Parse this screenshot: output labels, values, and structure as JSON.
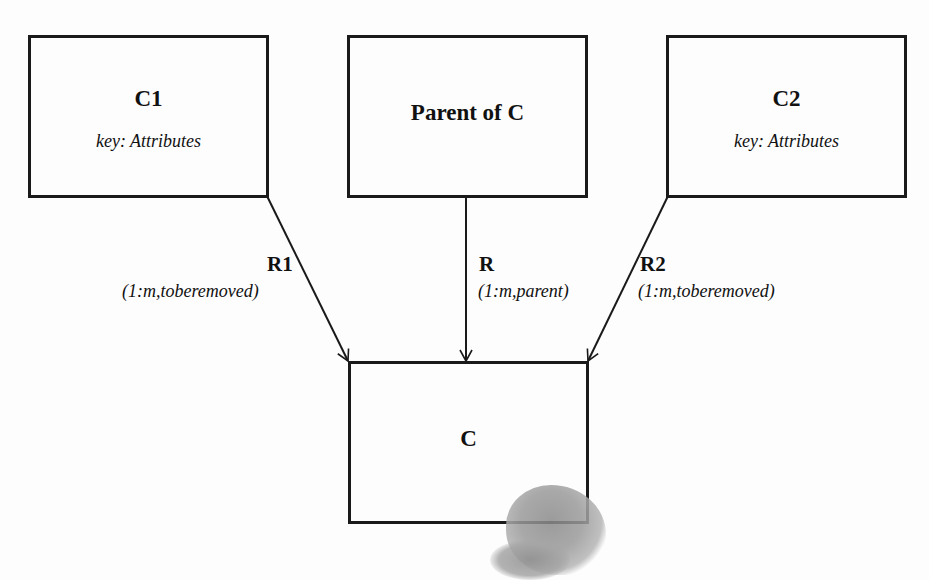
{
  "diagram": {
    "entities": [
      {
        "id": "C1",
        "title": "C1",
        "attribute": "key: Attributes"
      },
      {
        "id": "Parent",
        "title": "Parent of C",
        "attribute": ""
      },
      {
        "id": "C2",
        "title": "C2",
        "attribute": "key: Attributes"
      },
      {
        "id": "C",
        "title": "C",
        "attribute": ""
      }
    ],
    "relationships": [
      {
        "name": "R1",
        "cardinality": "(1:m,toberemoved)",
        "from": "C1",
        "to": "C"
      },
      {
        "name": "R",
        "cardinality": "(1:m,parent)",
        "from": "Parent of C",
        "to": "C"
      },
      {
        "name": "R2",
        "cardinality": "(1:m,toberemoved)",
        "from": "C2",
        "to": "C"
      }
    ],
    "colors": {
      "line": "#1a1a1a",
      "background": "#fdfdfd",
      "stain": "#8a8a8a"
    }
  }
}
